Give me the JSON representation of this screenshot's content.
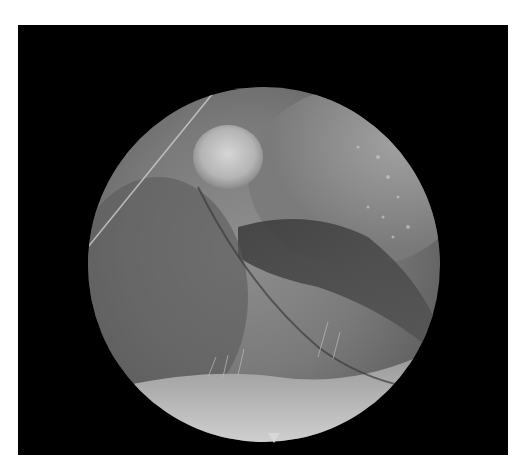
{
  "image": {
    "description": "Grayscale endoscopic view inside a circular field on a black background",
    "tone": "grayscale",
    "colors": {
      "background": "#000000",
      "page": "#ffffff",
      "tissue_mid": "#7a7a7a",
      "highlight": "#cfcfcf",
      "dark_fold": "#2e2e2e"
    },
    "features": [
      "bright round nodule near top center",
      "diagonal thin bright line at upper left",
      "dark crease/fold running to the right",
      "bright lower segment with fine hair-like strands",
      "small triangular notch marker at bottom edge"
    ]
  }
}
